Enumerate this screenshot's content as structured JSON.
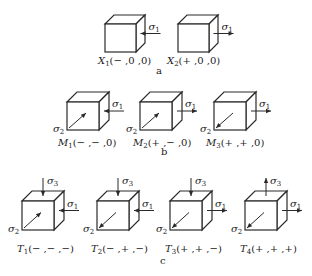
{
  "figure": {
    "groups": [
      {
        "label": "a",
        "label_pos": [
          156,
          74
        ],
        "cubes": [
          {
            "id": "X1",
            "caption_main": "X",
            "caption_sub": "1",
            "caption_rest": "(− ,0 ,0)",
            "x": 105,
            "y": 24,
            "w": 31,
            "h": 28,
            "d": 9,
            "caption_pos": [
              98,
              64
            ],
            "sigma1": "in",
            "sigma2": null,
            "sigma3": null
          },
          {
            "id": "X2",
            "caption_main": "X",
            "caption_sub": "2",
            "caption_rest": "(+ ,0 ,0)",
            "x": 178,
            "y": 24,
            "w": 31,
            "h": 28,
            "d": 9,
            "caption_pos": [
              167,
              64
            ],
            "sigma1": "out",
            "sigma2": null,
            "sigma3": null
          }
        ]
      },
      {
        "label": "b",
        "label_pos": [
          161,
          155
        ],
        "cubes": [
          {
            "id": "M1",
            "caption_main": "M",
            "caption_sub": "1",
            "caption_rest": "(− ,− ,0)",
            "x": 67,
            "y": 102,
            "w": 32,
            "h": 28,
            "d": 10,
            "caption_pos": [
              58,
              146
            ],
            "sigma1": "in",
            "sigma2": "in",
            "sigma3": null
          },
          {
            "id": "M2",
            "caption_main": "M",
            "caption_sub": "2",
            "caption_rest": "(+ ,− ,0)",
            "x": 140,
            "y": 102,
            "w": 32,
            "h": 28,
            "d": 10,
            "caption_pos": [
              133,
              146
            ],
            "sigma1": "out",
            "sigma2": "in",
            "sigma3": null
          },
          {
            "id": "M3",
            "caption_main": "M",
            "caption_sub": "3",
            "caption_rest": "(+ ,+ ,0)",
            "x": 214,
            "y": 102,
            "w": 32,
            "h": 28,
            "d": 10,
            "caption_pos": [
              206,
              146
            ],
            "sigma1": "out",
            "sigma2": "out",
            "sigma3": null
          }
        ]
      },
      {
        "label": "c",
        "label_pos": [
          160,
          264
        ],
        "cubes": [
          {
            "id": "T1",
            "caption_main": "T",
            "caption_sub": "1",
            "caption_rest": "(− ,− ,−)",
            "x": 22,
            "y": 201,
            "w": 32,
            "h": 29,
            "d": 10,
            "caption_pos": [
              17,
              252
            ],
            "sigma1": "in",
            "sigma2": "in",
            "sigma3": "in"
          },
          {
            "id": "T2",
            "caption_main": "T",
            "caption_sub": "2",
            "caption_rest": "(− ,+ ,−)",
            "x": 97,
            "y": 201,
            "w": 32,
            "h": 29,
            "d": 10,
            "caption_pos": [
              91,
              252
            ],
            "sigma1": "in",
            "sigma2": "out",
            "sigma3": "in"
          },
          {
            "id": "T3",
            "caption_main": "T",
            "caption_sub": "3",
            "caption_rest": "(+ ,+ ,−)",
            "x": 170,
            "y": 201,
            "w": 32,
            "h": 29,
            "d": 10,
            "caption_pos": [
              165,
              252
            ],
            "sigma1": "out",
            "sigma2": "out",
            "sigma3": "in"
          },
          {
            "id": "T4",
            "caption_main": "T",
            "caption_sub": "4",
            "caption_rest": "(+ ,+ ,+)",
            "x": 245,
            "y": 201,
            "w": 32,
            "h": 29,
            "d": 10,
            "caption_pos": [
              240,
              252
            ],
            "sigma1": "out",
            "sigma2": "out",
            "sigma3": "out"
          }
        ]
      }
    ],
    "symbols": {
      "sigma1": "σ",
      "sigma1_sub": "1",
      "sigma2": "σ",
      "sigma2_sub": "2",
      "sigma3": "σ",
      "sigma3_sub": "3"
    },
    "colors": {
      "line": "#2a2a2a",
      "text": "#222222",
      "background": "#ffffff"
    }
  }
}
